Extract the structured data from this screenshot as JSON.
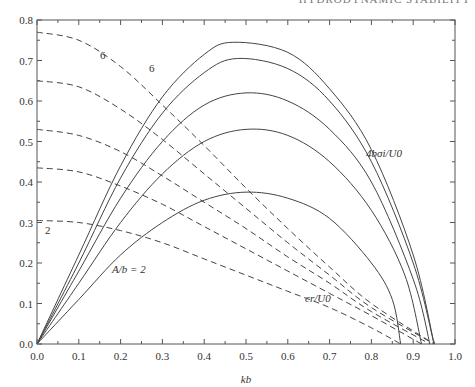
{
  "header": {
    "running_head": "HYDRODYNAMIC STABILITY"
  },
  "chart_data": {
    "type": "line",
    "title": "",
    "xlabel": "kb",
    "ylabel": "",
    "xlim": [
      0.0,
      1.0
    ],
    "ylim": [
      0.0,
      0.8
    ],
    "x_ticks": [
      "0.0",
      "0.1",
      "0.2",
      "0.3",
      "0.4",
      "0.5",
      "0.6",
      "0.7",
      "0.8",
      "0.9",
      "1.0"
    ],
    "y_ticks": [
      "0.0",
      "0.1",
      "0.2",
      "0.3",
      "0.4",
      "0.5",
      "0.6",
      "0.7",
      "0.8"
    ],
    "grid": false,
    "annotations": {
      "growth_label": "4bσi/U0",
      "speed_label": "cr/U0",
      "param_label": "A/b = 2",
      "dashed_low_label": "2",
      "dashed_high_label": "6",
      "solid_high_label": "6"
    },
    "series": [
      {
        "name": "4bσi/U0, A/b=2",
        "style": "solid",
        "x": [
          0,
          0.1,
          0.2,
          0.3,
          0.4,
          0.5,
          0.6,
          0.7,
          0.8,
          0.85,
          0.87
        ],
        "y": [
          0,
          0.11,
          0.22,
          0.3,
          0.355,
          0.375,
          0.36,
          0.31,
          0.2,
          0.11,
          0
        ]
      },
      {
        "name": "4bσi/U0, A/b=3",
        "style": "solid",
        "x": [
          0,
          0.1,
          0.2,
          0.3,
          0.4,
          0.5,
          0.6,
          0.7,
          0.8,
          0.88,
          0.92
        ],
        "y": [
          0,
          0.15,
          0.3,
          0.42,
          0.5,
          0.53,
          0.515,
          0.45,
          0.33,
          0.17,
          0
        ]
      },
      {
        "name": "4bσi/U0, A/b=4",
        "style": "solid",
        "x": [
          0,
          0.1,
          0.2,
          0.3,
          0.4,
          0.5,
          0.6,
          0.7,
          0.8,
          0.9,
          0.94
        ],
        "y": [
          0,
          0.18,
          0.36,
          0.5,
          0.59,
          0.62,
          0.6,
          0.53,
          0.4,
          0.16,
          0
        ]
      },
      {
        "name": "4bσi/U0, A/b=5",
        "style": "solid",
        "x": [
          0,
          0.1,
          0.2,
          0.3,
          0.4,
          0.48,
          0.6,
          0.7,
          0.8,
          0.9,
          0.95
        ],
        "y": [
          0,
          0.2,
          0.41,
          0.57,
          0.67,
          0.705,
          0.68,
          0.6,
          0.45,
          0.2,
          0
        ]
      },
      {
        "name": "4bσi/U0, A/b=6",
        "style": "solid",
        "x": [
          0,
          0.1,
          0.2,
          0.3,
          0.4,
          0.47,
          0.6,
          0.7,
          0.8,
          0.9,
          0.95
        ],
        "y": [
          0,
          0.22,
          0.44,
          0.61,
          0.715,
          0.745,
          0.72,
          0.63,
          0.48,
          0.22,
          0
        ]
      },
      {
        "name": "cr/U0, A/b=2",
        "style": "dashed",
        "x": [
          0,
          0.1,
          0.2,
          0.3,
          0.4,
          0.5,
          0.6,
          0.7,
          0.8,
          0.87
        ],
        "y": [
          0.305,
          0.3,
          0.28,
          0.25,
          0.21,
          0.17,
          0.13,
          0.09,
          0.04,
          0
        ]
      },
      {
        "name": "cr/U0, A/b=3",
        "style": "dashed",
        "x": [
          0,
          0.1,
          0.2,
          0.3,
          0.4,
          0.5,
          0.6,
          0.7,
          0.8,
          0.92
        ],
        "y": [
          0.435,
          0.425,
          0.39,
          0.345,
          0.29,
          0.235,
          0.18,
          0.125,
          0.07,
          0
        ]
      },
      {
        "name": "cr/U0, A/b=4",
        "style": "dashed",
        "x": [
          0,
          0.1,
          0.2,
          0.3,
          0.4,
          0.5,
          0.6,
          0.7,
          0.8,
          0.94
        ],
        "y": [
          0.53,
          0.515,
          0.475,
          0.415,
          0.35,
          0.285,
          0.215,
          0.15,
          0.08,
          0
        ]
      },
      {
        "name": "cr/U0, A/b=5",
        "style": "dashed",
        "x": [
          0,
          0.1,
          0.2,
          0.3,
          0.4,
          0.5,
          0.6,
          0.7,
          0.8,
          0.95
        ],
        "y": [
          0.65,
          0.635,
          0.58,
          0.505,
          0.42,
          0.335,
          0.25,
          0.17,
          0.09,
          0
        ]
      },
      {
        "name": "cr/U0, A/b=6",
        "style": "dashed",
        "x": [
          0,
          0.1,
          0.2,
          0.3,
          0.4,
          0.5,
          0.6,
          0.7,
          0.8,
          0.95
        ],
        "y": [
          0.77,
          0.75,
          0.685,
          0.59,
          0.49,
          0.385,
          0.285,
          0.19,
          0.1,
          0
        ]
      }
    ]
  }
}
